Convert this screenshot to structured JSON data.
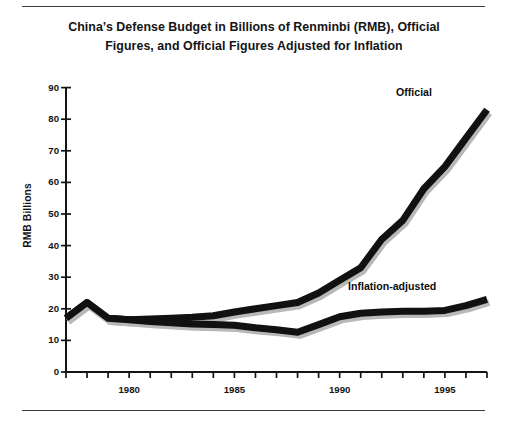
{
  "title": "China’s Defense Budget in Billions of Renminbi (RMB), Official Figures, and Official Figures Adjusted for Inflation",
  "axes": {
    "ylabel": "RMB Billions",
    "yticks": [
      "0",
      "10",
      "20",
      "30",
      "40",
      "50",
      "60",
      "70",
      "80",
      "90"
    ],
    "xticks_labeled": [
      "1980",
      "1985",
      "1990",
      "1995"
    ]
  },
  "labels": {
    "official": "Official",
    "inflation_adjusted": "Inflation-adjusted"
  },
  "chart_data": {
    "type": "line",
    "title": "China’s Defense Budget in Billions of Renminbi (RMB), Official Figures, and Official Figures Adjusted for Inflation",
    "xlabel": "",
    "ylabel": "RMB Billions",
    "xlim": [
      1977,
      1997
    ],
    "ylim": [
      0,
      90
    ],
    "ytick_step": 10,
    "xtick_step": 1,
    "xticks_labeled": [
      1980,
      1985,
      1990,
      1995
    ],
    "grid": false,
    "legend": "inline-annotations",
    "x": [
      1977,
      1978,
      1979,
      1980,
      1981,
      1982,
      1983,
      1984,
      1985,
      1986,
      1987,
      1988,
      1989,
      1990,
      1991,
      1992,
      1993,
      1994,
      1995,
      1996,
      1997
    ],
    "series": [
      {
        "name": "Official",
        "color": "#111111",
        "values": [
          17.0,
          22.0,
          17.0,
          16.5,
          16.8,
          17.0,
          17.3,
          17.8,
          19.0,
          20.0,
          21.0,
          22.0,
          25.0,
          29.0,
          33.0,
          42.0,
          48.0,
          58.0,
          65.0,
          74.0,
          83.0
        ]
      },
      {
        "name": "Inflation-adjusted",
        "color": "#111111",
        "values": [
          17.0,
          22.0,
          17.0,
          16.5,
          16.0,
          15.6,
          15.2,
          15.0,
          14.8,
          14.0,
          13.4,
          12.6,
          15.0,
          17.5,
          18.6,
          19.0,
          19.2,
          19.2,
          19.5,
          21.0,
          23.0
        ]
      }
    ]
  }
}
